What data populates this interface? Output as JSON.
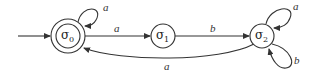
{
  "diagram": {
    "type": "finite-state-automaton",
    "states": [
      {
        "id": "s0",
        "symbol": "σ",
        "subscript": "0",
        "accepting": true,
        "initial": true
      },
      {
        "id": "s1",
        "symbol": "σ",
        "subscript": "1",
        "accepting": false,
        "initial": false
      },
      {
        "id": "s2",
        "symbol": "σ",
        "subscript": "2",
        "accepting": false,
        "initial": false
      }
    ],
    "transitions": [
      {
        "from": "s0",
        "to": "s0",
        "label": "a"
      },
      {
        "from": "s0",
        "to": "s1",
        "label": "a"
      },
      {
        "from": "s1",
        "to": "s2",
        "label": "b"
      },
      {
        "from": "s2",
        "to": "s2",
        "label": "a"
      },
      {
        "from": "s2",
        "to": "s2",
        "label": "b"
      },
      {
        "from": "s2",
        "to": "s0",
        "label": "a"
      }
    ]
  },
  "colors": {
    "stroke": "#333333",
    "background": "#ffffff"
  }
}
